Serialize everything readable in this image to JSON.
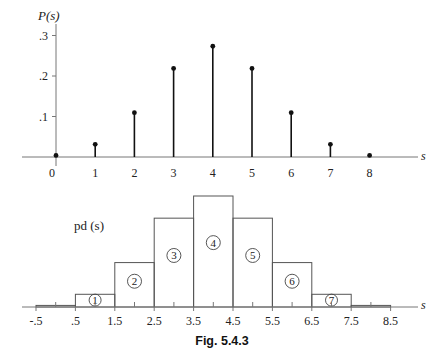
{
  "figure_caption": "Fig. 5.4.3",
  "chart_data": [
    {
      "type": "stem",
      "ylabel": "P(s)",
      "xlabel": "s",
      "x": [
        0,
        1,
        2,
        3,
        4,
        5,
        6,
        7,
        8
      ],
      "x_tick_labels": [
        "0",
        "1",
        "2",
        "3",
        "4",
        "5",
        "6",
        "7",
        "8"
      ],
      "values": [
        0.0039,
        0.0313,
        0.1094,
        0.2188,
        0.2734,
        0.2188,
        0.1094,
        0.0313,
        0.0039
      ],
      "y_ticks": [
        0.1,
        0.2,
        0.3
      ],
      "y_tick_labels": [
        ".1",
        ".2",
        ".3"
      ],
      "ylim": [
        0,
        0.3
      ],
      "xlim": [
        -1,
        9
      ],
      "grid": false
    },
    {
      "type": "bar",
      "ylabel": "pd (s)",
      "xlabel": "s",
      "bin_edges": [
        -0.5,
        0.5,
        1.5,
        2.5,
        3.5,
        4.5,
        5.5,
        6.5,
        7.5,
        8.5
      ],
      "x_tick_labels": [
        "-.5",
        ".5",
        "1.5",
        "2.5",
        "3.5",
        "4.5",
        "5.5",
        "6.5",
        "7.5",
        "8.5"
      ],
      "values": [
        0.0039,
        0.0313,
        0.1094,
        0.2188,
        0.2734,
        0.2188,
        0.1094,
        0.0313,
        0.0039
      ],
      "bar_labels": [
        "",
        "1",
        "2",
        "3",
        "4",
        "5",
        "6",
        "7",
        ""
      ],
      "grid": false
    }
  ]
}
